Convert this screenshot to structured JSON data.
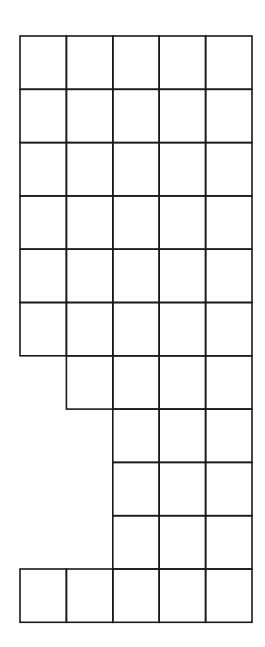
{
  "diagram": {
    "type": "grid-shape",
    "columns": 5,
    "rows": 11,
    "origin": [
      20,
      36
    ],
    "cell_width": 46.4,
    "cell_height": 53.3,
    "line_color": "#1a1a1a",
    "row_spans": [
      {
        "row": 0,
        "from_col": 0,
        "to_col": 4
      },
      {
        "row": 1,
        "from_col": 0,
        "to_col": 4
      },
      {
        "row": 2,
        "from_col": 0,
        "to_col": 4
      },
      {
        "row": 3,
        "from_col": 0,
        "to_col": 4
      },
      {
        "row": 4,
        "from_col": 0,
        "to_col": 4
      },
      {
        "row": 5,
        "from_col": 0,
        "to_col": 4
      },
      {
        "row": 6,
        "from_col": 1,
        "to_col": 4
      },
      {
        "row": 7,
        "from_col": 2,
        "to_col": 4
      },
      {
        "row": 8,
        "from_col": 2,
        "to_col": 4
      },
      {
        "row": 9,
        "from_col": 2,
        "to_col": 4
      },
      {
        "row": 10,
        "from_col": 0,
        "to_col": 4
      }
    ],
    "total_cells": 45
  }
}
